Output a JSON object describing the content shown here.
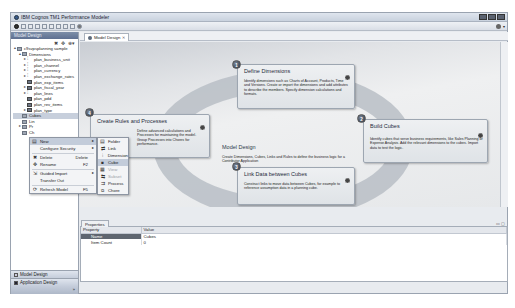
{
  "window": {
    "title": "IBM Cognos TM1 Performance Modeler"
  },
  "left_panel": {
    "header": "Model Design",
    "tree": [
      {
        "label": "c9svpsplanning sample",
        "level": 0,
        "twisty": "▲",
        "icon": "folder"
      },
      {
        "label": "Dimensions",
        "level": 1,
        "twisty": "▲",
        "icon": "folder"
      },
      {
        "label": "plan_business_unit",
        "level": 2,
        "twisty": "▸",
        "icon": "dim"
      },
      {
        "label": "plan_channel",
        "level": 2,
        "twisty": "▸",
        "icon": "dim"
      },
      {
        "label": "plan_currency",
        "level": 2,
        "twisty": "▸",
        "icon": "dim"
      },
      {
        "label": "plan_exchange_rates",
        "level": 2,
        "twisty": "▸",
        "icon": "dim"
      },
      {
        "label": "plan_exp_items",
        "level": 2,
        "twisty": "",
        "icon": "dimalt"
      },
      {
        "label": "plan_fiscal_year",
        "level": 2,
        "twisty": "▸",
        "icon": "dimalt"
      },
      {
        "label": "plan_lines",
        "level": 2,
        "twisty": "▸",
        "icon": "dim"
      },
      {
        "label": "plan_pdd",
        "level": 2,
        "twisty": "",
        "icon": "dimalt"
      },
      {
        "label": "plan_rev_items",
        "level": 2,
        "twisty": "",
        "icon": "dimalt"
      },
      {
        "label": "plan_type",
        "level": 2,
        "twisty": "▸",
        "icon": "dimalt"
      },
      {
        "label": "Cubes",
        "level": 1,
        "twisty": "",
        "icon": "folder",
        "selected": true
      },
      {
        "label": "Lin",
        "level": 1,
        "twisty": "",
        "icon": "folder"
      },
      {
        "label": "Pr",
        "level": 1,
        "twisty": "▸",
        "icon": "folder"
      },
      {
        "label": "Ch",
        "level": 1,
        "twisty": "",
        "icon": "folder"
      }
    ],
    "nav_buttons": [
      {
        "label": "Model Design",
        "active": false
      },
      {
        "label": "Application Design",
        "active": true
      }
    ]
  },
  "context_menu": {
    "items": [
      {
        "label": "New",
        "icon": "▤",
        "submenu": true,
        "highlighted": true
      },
      {
        "label": "Configure Security",
        "icon": "",
        "submenu": true
      },
      {
        "sep": true
      },
      {
        "label": "Delete",
        "icon": "✖",
        "shortcut": "Delete"
      },
      {
        "label": "Rename",
        "icon": "✥",
        "shortcut": "F2"
      },
      {
        "sep": true
      },
      {
        "label": "Guided Import",
        "icon": "⇲",
        "submenu": true
      },
      {
        "label": "Transfer Out",
        "icon": ""
      },
      {
        "sep": true
      },
      {
        "label": "Refresh Model",
        "icon": "⟳",
        "shortcut": "F5"
      }
    ]
  },
  "submenu_new": {
    "items": [
      {
        "label": "Folder",
        "icon": "▤"
      },
      {
        "label": "Link",
        "icon": "⇄"
      },
      {
        "label": "Dimension",
        "icon": "⫶"
      },
      {
        "label": "Cube",
        "icon": "■",
        "highlighted": true
      },
      {
        "label": "View",
        "icon": "▦",
        "disabled": true
      },
      {
        "label": "Subset",
        "icon": "⇆",
        "disabled": true
      },
      {
        "label": "Process",
        "icon": "⇉"
      },
      {
        "label": "Chore",
        "icon": "⧉"
      }
    ]
  },
  "editor": {
    "tab_label": "Model Design",
    "tab_close": "✕",
    "center": {
      "title": "Model Design",
      "desc": "Create Dimensions, Cubes, Links and Rules to define the business logic for a Contributor Application"
    },
    "cards": [
      {
        "num": "1",
        "title": "Define Dimensions",
        "desc": "Identify dimensions such as Charts of Account, Products, Time and Versions. Create or import the dimensions and add attributes to describe the members. Specify dimension calculations and formats."
      },
      {
        "num": "2",
        "title": "Build Cubes",
        "desc": "Identify cubes that serve business requirements, like Sales Planning or Expense Analysis. Add the relevant dimensions to the cubes. Import data to test the logic."
      },
      {
        "num": "3",
        "title": "Link Data between Cubes",
        "desc": "Construct links to move data between Cubes, for example to reference assumption data in a planning cube."
      },
      {
        "num": "4",
        "title": "Create Rules and Processes",
        "desc": "Define advanced calculations and Processes for maintaining the model. Group Processes into Chores for performance."
      }
    ]
  },
  "properties": {
    "tab_label": "Properties",
    "columns": [
      "Property",
      "Value"
    ],
    "rows": [
      {
        "name": "Name",
        "value": "Cubes",
        "selected": true
      },
      {
        "name": "Item Count",
        "value": "0"
      }
    ]
  }
}
